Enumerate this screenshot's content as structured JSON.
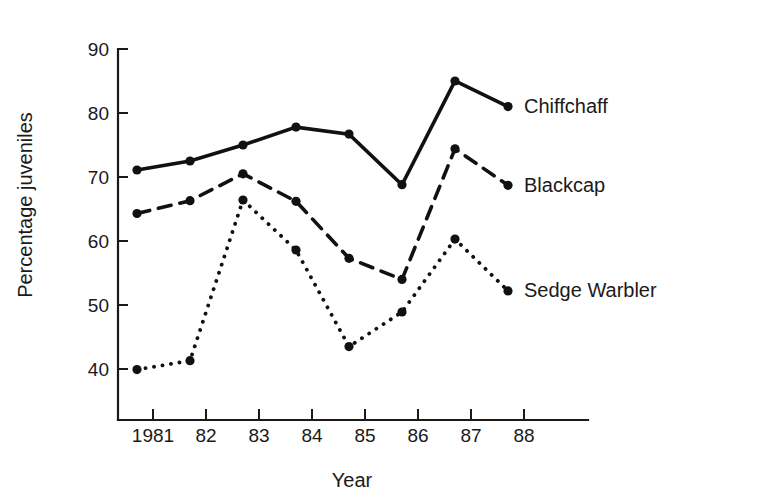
{
  "chart_data": {
    "type": "line",
    "title": "",
    "xlabel": "Year",
    "ylabel": "Percentage juveniles",
    "categories": [
      "1981",
      "82",
      "83",
      "84",
      "85",
      "86",
      "87",
      "88"
    ],
    "x_tick_labels": [
      "1981",
      "82",
      "83",
      "84",
      "85",
      "86",
      "87",
      "88"
    ],
    "y_tick_labels": [
      "40",
      "50",
      "60",
      "70",
      "80",
      "90"
    ],
    "y_ticks": [
      40,
      50,
      60,
      70,
      80,
      90
    ],
    "ylim": [
      36,
      90
    ],
    "xlim": [
      1980.7,
      1988.3
    ],
    "grid": false,
    "legend_position": "right-inline-end-of-line",
    "series": [
      {
        "name": "Chiffchaff",
        "style": "solid",
        "marker": "filled-circle",
        "color": "#111111",
        "values": [
          71.1,
          72.5,
          75.0,
          77.8,
          76.7,
          68.8,
          85.0,
          81.0
        ]
      },
      {
        "name": "Blackcap",
        "style": "dashed",
        "marker": "filled-circle",
        "color": "#111111",
        "values": [
          64.3,
          66.3,
          70.5,
          66.2,
          57.3,
          54.0,
          74.4,
          68.7
        ]
      },
      {
        "name": "Sedge Warbler",
        "style": "dotted",
        "marker": "filled-circle",
        "color": "#111111",
        "values": [
          39.9,
          41.3,
          66.4,
          58.6,
          43.5,
          48.9,
          60.3,
          52.2
        ]
      }
    ]
  }
}
